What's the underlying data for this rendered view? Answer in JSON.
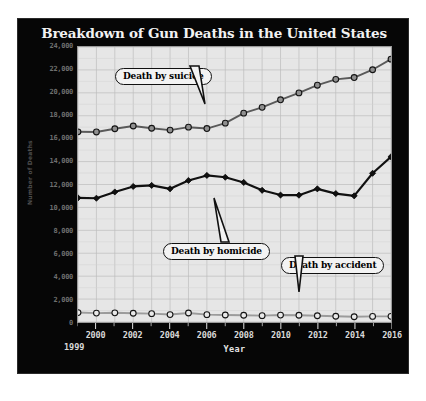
{
  "chart_data": {
    "type": "line",
    "title": "Breakdown of Gun Deaths in the United States",
    "xlabel": "Year",
    "ylabel": "Number of Deaths",
    "source": "Source: Centers for Disease Control and Prevention, National Center for Health Statistics, Multiple Cause of Death 1999-2016",
    "x": [
      1999,
      2000,
      2001,
      2002,
      2003,
      2004,
      2005,
      2006,
      2007,
      2008,
      2009,
      2010,
      2011,
      2012,
      2013,
      2014,
      2015,
      2016
    ],
    "categories": [
      "1999",
      "2000",
      "2001",
      "2002",
      "2003",
      "2004",
      "2005",
      "2006",
      "2007",
      "2008",
      "2009",
      "2010",
      "2011",
      "2012",
      "2013",
      "2014",
      "2015",
      "2016"
    ],
    "xtick_labels": [
      "2000",
      "2002",
      "2004",
      "2006",
      "2008",
      "2010",
      "2012",
      "2014",
      "2016"
    ],
    "xtick_first_label": "1999",
    "xlim": [
      1999,
      2016
    ],
    "ylim": [
      0,
      24000
    ],
    "ytick_labels": [
      "24,000",
      "22,000",
      "20,000",
      "18,000",
      "16,000",
      "14,000",
      "12,000",
      "10,000",
      "8,000",
      "6,000",
      "4,000",
      "2,000",
      "0"
    ],
    "ytick_values": [
      24000,
      22000,
      20000,
      18000,
      16000,
      14000,
      12000,
      10000,
      8000,
      6000,
      4000,
      2000,
      0
    ],
    "grid": true,
    "legend": "annotations",
    "series": [
      {
        "name": "Death by suicide",
        "marker": "circle",
        "color": "#5a5a5a",
        "values": [
          16599,
          16586,
          16869,
          17108,
          16907,
          16750,
          17002,
          16883,
          17352,
          18223,
          18735,
          19392,
          19990,
          20666,
          21175,
          21334,
          22018,
          22938
        ]
      },
      {
        "name": "Death by homicide",
        "marker": "diamond",
        "color": "#111111",
        "values": [
          10828,
          10801,
          11348,
          11829,
          11920,
          11624,
          12352,
          12791,
          12632,
          12179,
          11493,
          11078,
          11068,
          11622,
          11208,
          11008,
          12979,
          14415
        ]
      },
      {
        "name": "Death by accident",
        "marker": "circle",
        "color": "#9b9b9b",
        "values": [
          824,
          776,
          802,
          762,
          730,
          649,
          789,
          642,
          613,
          592,
          554,
          606,
          591,
          548,
          505,
          461,
          489,
          495
        ]
      }
    ],
    "annotations": [
      {
        "label": "Death by suicide",
        "points_to_year": 2006
      },
      {
        "label": "Death by homicide",
        "points_to_year": 2007
      },
      {
        "label": "Death by accident",
        "points_to_year": 2013
      }
    ]
  }
}
